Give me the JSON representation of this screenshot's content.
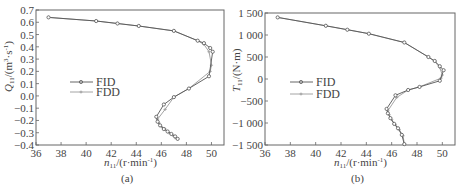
{
  "chart_data": [
    {
      "type": "line",
      "panel_label": "(a)",
      "title": "",
      "xlabel": "n11/(r·min-1)",
      "ylabel": "Q11/(m3·s-1)",
      "xlim": [
        36,
        51
      ],
      "ylim": [
        -0.4,
        0.7
      ],
      "x_ticks": [
        "36",
        "38",
        "40",
        "42",
        "44",
        "46",
        "48",
        "50"
      ],
      "y_ticks": [
        "0.7",
        "0.6",
        "0.5",
        "0.4",
        "0.3",
        "0.2",
        "0.1",
        "0.0",
        "-0.1",
        "-0.2",
        "-0.3",
        "-0.4"
      ],
      "grid": false,
      "legend": {
        "position": "center-left",
        "entries": [
          "FID",
          "FDD"
        ]
      },
      "series": [
        {
          "name": "FID",
          "color": "#555555",
          "marker": "circle",
          "x": [
            37.0,
            40.8,
            42.5,
            44.2,
            47.0,
            48.9,
            49.4,
            49.9,
            50.1,
            49.8,
            48.2,
            47.0,
            46.2,
            45.6,
            45.7,
            45.9,
            46.2,
            46.5,
            46.8,
            47.1,
            47.3
          ],
          "y": [
            0.64,
            0.61,
            0.59,
            0.57,
            0.53,
            0.45,
            0.43,
            0.39,
            0.36,
            0.16,
            0.06,
            -0.01,
            -0.07,
            -0.17,
            -0.21,
            -0.24,
            -0.27,
            -0.29,
            -0.31,
            -0.33,
            -0.35
          ]
        },
        {
          "name": "FDD",
          "color": "#9a9a9a",
          "marker": "plus",
          "x": [
            37.0,
            40.8,
            42.5,
            44.2,
            47.0,
            48.9,
            49.4,
            49.8,
            50.0,
            49.9,
            48.2,
            47.0,
            46.3,
            45.7,
            45.8,
            46.0,
            46.3,
            46.6,
            46.9,
            47.1,
            47.3
          ],
          "y": [
            0.64,
            0.61,
            0.59,
            0.57,
            0.53,
            0.45,
            0.42,
            0.36,
            0.25,
            0.2,
            0.06,
            -0.01,
            -0.11,
            -0.19,
            -0.22,
            -0.25,
            -0.27,
            -0.3,
            -0.32,
            -0.34,
            -0.35
          ]
        }
      ]
    },
    {
      "type": "line",
      "panel_label": "(b)",
      "title": "",
      "xlabel": "n11/(r·min-1)",
      "ylabel": "T11/(N·m)",
      "xlim": [
        36,
        51
      ],
      "ylim": [
        -1500,
        1500
      ],
      "x_ticks": [
        "36",
        "38",
        "40",
        "42",
        "44",
        "46",
        "48",
        "50"
      ],
      "y_ticks": [
        "1 500",
        "1 000",
        "500",
        "0",
        "-500",
        "-1 000",
        "-1 500"
      ],
      "grid": false,
      "legend": {
        "position": "center-left",
        "entries": [
          "FID",
          "FDD"
        ]
      },
      "series": [
        {
          "name": "FID",
          "color": "#555555",
          "marker": "circle",
          "x": [
            37.0,
            40.8,
            42.5,
            44.2,
            47.0,
            48.9,
            49.4,
            49.8,
            50.1,
            49.8,
            48.2,
            47.3,
            46.3,
            45.6,
            45.7,
            45.9,
            46.2,
            46.5,
            46.8,
            47.0
          ],
          "y": [
            1400,
            1210,
            1120,
            1030,
            830,
            500,
            410,
            290,
            200,
            -40,
            -180,
            -250,
            -370,
            -680,
            -780,
            -890,
            -1020,
            -1120,
            -1270,
            -1480
          ],
          "note": "values estimated from plot geometry"
        },
        {
          "name": "FDD",
          "color": "#9a9a9a",
          "marker": "plus",
          "x": [
            37.0,
            40.8,
            42.5,
            44.2,
            47.0,
            48.9,
            49.4,
            49.8,
            50.0,
            49.9,
            48.2,
            47.3,
            46.4,
            45.7,
            45.8,
            46.0,
            46.3,
            46.6,
            46.9,
            47.0
          ],
          "y": [
            1400,
            1210,
            1120,
            1030,
            830,
            500,
            400,
            260,
            90,
            20,
            -180,
            -250,
            -420,
            -720,
            -810,
            -920,
            -1040,
            -1150,
            -1290,
            -1480
          ]
        }
      ]
    }
  ],
  "panels": {
    "a": {
      "caption": "(a)",
      "xlabel_main": "n",
      "xlabel_sub": "11",
      "xlabel_unit": "/(r·min",
      "xlabel_sup": "-1",
      "xlabel_end": ")",
      "ylabel_main": "Q",
      "ylabel_sub": "11",
      "ylabel_unit": "/(m",
      "ylabel_sup1": "3",
      "ylabel_mid": "·s",
      "ylabel_sup2": "-1",
      "ylabel_end": ")",
      "legend_fid": "FID",
      "legend_fdd": "FDD"
    },
    "b": {
      "caption": "(b)",
      "xlabel_main": "n",
      "xlabel_sub": "11",
      "xlabel_unit": "/(r·min",
      "xlabel_sup": "-1",
      "xlabel_end": ")",
      "ylabel_main": "T",
      "ylabel_sub": "11",
      "ylabel_unit": "/(N·m)",
      "legend_fid": "FID",
      "legend_fdd": "FDD"
    }
  }
}
